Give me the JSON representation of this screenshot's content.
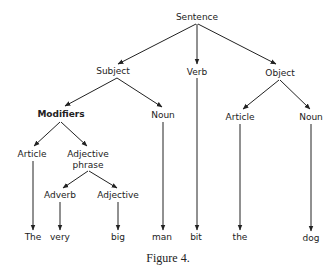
{
  "diagram": {
    "type": "parse-tree",
    "caption": "Figure 4.",
    "nodes": {
      "sentence": {
        "label": "Sentence",
        "x": 197,
        "y": 20
      },
      "subject": {
        "label": "Subject",
        "x": 113,
        "y": 74
      },
      "verb": {
        "label": "Verb",
        "x": 197,
        "y": 74
      },
      "object": {
        "label": "Object",
        "x": 280,
        "y": 75
      },
      "modifiers": {
        "label": "Modifiers",
        "x": 61,
        "y": 117
      },
      "subj_noun": {
        "label": "Noun",
        "x": 163,
        "y": 117
      },
      "obj_article": {
        "label": "Article",
        "x": 240,
        "y": 119
      },
      "obj_noun": {
        "label": "Noun",
        "x": 311,
        "y": 119
      },
      "mod_article": {
        "label": "Article",
        "x": 32,
        "y": 156
      },
      "adj_phrase": {
        "label_line1": "Adjective",
        "label_line2": "phrase",
        "x": 88,
        "y": 156
      },
      "adverb": {
        "label": "Adverb",
        "x": 60,
        "y": 198
      },
      "adjective": {
        "label": "Adjective",
        "x": 118,
        "y": 198
      },
      "w_the": {
        "label": "The",
        "x": 33,
        "y": 238
      },
      "w_very": {
        "label": "very",
        "x": 60,
        "y": 238
      },
      "w_big": {
        "label": "big",
        "x": 118,
        "y": 238
      },
      "w_man": {
        "label": "man",
        "x": 162,
        "y": 238
      },
      "w_bit": {
        "label": "bit",
        "x": 196,
        "y": 238
      },
      "w_the2": {
        "label": "the",
        "x": 240,
        "y": 238
      },
      "w_dog": {
        "label": "dog",
        "x": 311,
        "y": 239
      }
    },
    "edges": [
      [
        "sentence",
        "subject"
      ],
      [
        "sentence",
        "verb"
      ],
      [
        "sentence",
        "object"
      ],
      [
        "subject",
        "modifiers"
      ],
      [
        "subject",
        "subj_noun"
      ],
      [
        "object",
        "obj_article"
      ],
      [
        "object",
        "obj_noun"
      ],
      [
        "modifiers",
        "mod_article"
      ],
      [
        "modifiers",
        "adj_phrase"
      ],
      [
        "adj_phrase",
        "adverb"
      ],
      [
        "adj_phrase",
        "adjective"
      ],
      [
        "mod_article",
        "w_the"
      ],
      [
        "adverb",
        "w_very"
      ],
      [
        "adjective",
        "w_big"
      ],
      [
        "subj_noun",
        "w_man"
      ],
      [
        "verb",
        "w_bit"
      ],
      [
        "obj_article",
        "w_the2"
      ],
      [
        "obj_noun",
        "w_dog"
      ]
    ]
  }
}
